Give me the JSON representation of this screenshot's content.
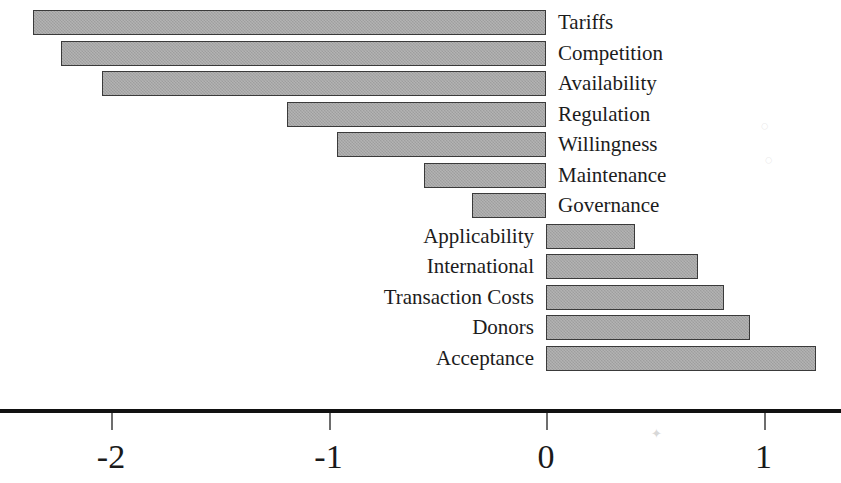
{
  "chart_data": {
    "type": "bar",
    "orientation": "horizontal",
    "title": "",
    "subtitle": "",
    "xlabel": "",
    "ylabel": "",
    "xlim": [
      -2.55,
      1.36
    ],
    "xticks": [
      -2,
      -1,
      0,
      1
    ],
    "xtick_labels": [
      "-2",
      "-1",
      "0",
      "1"
    ],
    "grid": false,
    "legend": null,
    "zero_reference": 0,
    "bar_color": "#a6a6a6",
    "bar_border_color": "#3a3a3a",
    "axis_color": "#111111",
    "categories": [
      "Tariffs",
      "Competition",
      "Availability",
      "Regulation",
      "Willingness",
      "Maintenance",
      "Governance",
      "Applicability",
      "International",
      "Transaction Costs",
      "Donors",
      "Acceptance"
    ],
    "values": [
      -2.36,
      -2.23,
      -2.04,
      -1.19,
      -0.96,
      -0.56,
      -0.34,
      0.41,
      0.7,
      0.82,
      0.94,
      1.24
    ],
    "bars": [
      {
        "label": "Tariffs",
        "value": -2.36,
        "label_side": "right"
      },
      {
        "label": "Competition",
        "value": -2.23,
        "label_side": "right"
      },
      {
        "label": "Availability",
        "value": -2.04,
        "label_side": "right"
      },
      {
        "label": "Regulation",
        "value": -1.19,
        "label_side": "right"
      },
      {
        "label": "Willingness",
        "value": -0.96,
        "label_side": "right"
      },
      {
        "label": "Maintenance",
        "value": -0.56,
        "label_side": "right"
      },
      {
        "label": "Governance",
        "value": -0.34,
        "label_side": "right"
      },
      {
        "label": "Applicability",
        "value": 0.41,
        "label_side": "left"
      },
      {
        "label": "International",
        "value": 0.7,
        "label_side": "left"
      },
      {
        "label": "Transaction Costs",
        "value": 0.82,
        "label_side": "left"
      },
      {
        "label": "Donors",
        "value": 0.94,
        "label_side": "left"
      },
      {
        "label": "Acceptance",
        "value": 1.24,
        "label_side": "left"
      }
    ]
  }
}
